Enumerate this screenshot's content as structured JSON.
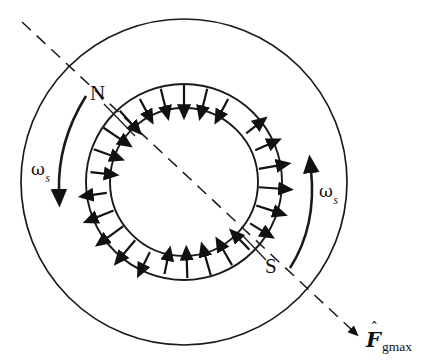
{
  "figure": {
    "kind": "rotating-mmf-wave"
  },
  "geometry": {
    "center_x": 184,
    "center_y": 182,
    "outer_radius": 163,
    "gap_outer_radius": 98,
    "rotor_radius": 74,
    "stroke_color": "#1a1a1a",
    "arrow_color": "#111111",
    "background": "#ffffff"
  },
  "labels": {
    "north_pole": "N",
    "south_pole": "S",
    "omega_left": "ω",
    "omega_left_sub": "s",
    "omega_right": "ω",
    "omega_right_sub": "s",
    "mmf_symbol": "F",
    "mmf_hat": "ˆ",
    "mmf_subscript": "gmax"
  },
  "axis": {
    "name": "magnetic-axis",
    "style": "dashed",
    "start_x": 22,
    "start_y": 22,
    "end_x": 352,
    "end_y": 330,
    "arrow_at_end": true,
    "dash_pattern": "12 8"
  },
  "rotation": {
    "left_arrow_name": "omega-s-left-arrow",
    "left_direction": "downward",
    "right_arrow_name": "omega-s-right-arrow",
    "right_direction": "upward",
    "sense": "counterclockwise-as-drawn"
  },
  "chart_data": {
    "type": "scatter",
    "xlabel": "angle around air gap (degrees)",
    "ylabel": "radial MMF direction",
    "legend": [
      "inward (N pole)",
      "outward (S pole)"
    ],
    "note": "Each data point is one radial arrow in the air gap; sign = +1 outward, -1 inward; magnitude is the drawn arrow length in pixels.",
    "arrows": [
      {
        "angle_deg": 118,
        "sign": -1,
        "length": 16
      },
      {
        "angle_deg": 104,
        "sign": -1,
        "length": 20
      },
      {
        "angle_deg": 90,
        "sign": -1,
        "length": 22
      },
      {
        "angle_deg": 76,
        "sign": -1,
        "length": 20
      },
      {
        "angle_deg": 62,
        "sign": -1,
        "length": 16
      },
      {
        "angle_deg": 132,
        "sign": -1,
        "length": 20
      },
      {
        "angle_deg": 146,
        "sign": -1,
        "length": 22
      },
      {
        "angle_deg": 160,
        "sign": -1,
        "length": 20
      },
      {
        "angle_deg": 174,
        "sign": -1,
        "length": 16
      },
      {
        "angle_deg": 188,
        "sign": 1,
        "length": 16
      },
      {
        "angle_deg": 202,
        "sign": 1,
        "length": 20
      },
      {
        "angle_deg": 216,
        "sign": 1,
        "length": 22
      },
      {
        "angle_deg": 230,
        "sign": 1,
        "length": 20
      },
      {
        "angle_deg": 244,
        "sign": 1,
        "length": 16
      },
      {
        "angle_deg": 258,
        "sign": -1,
        "length": 16
      },
      {
        "angle_deg": 272,
        "sign": -1,
        "length": 20
      },
      {
        "angle_deg": 286,
        "sign": -1,
        "length": 22
      },
      {
        "angle_deg": 300,
        "sign": -1,
        "length": 20
      },
      {
        "angle_deg": 314,
        "sign": -1,
        "length": 16
      },
      {
        "angle_deg": 328,
        "sign": 1,
        "length": 16
      },
      {
        "angle_deg": 342,
        "sign": 1,
        "length": 20
      },
      {
        "angle_deg": 356,
        "sign": 1,
        "length": 22
      },
      {
        "angle_deg": 10,
        "sign": 1,
        "length": 20
      },
      {
        "angle_deg": 24,
        "sign": 1,
        "length": 16
      },
      {
        "angle_deg": 38,
        "sign": 1,
        "length": 14
      }
    ]
  }
}
